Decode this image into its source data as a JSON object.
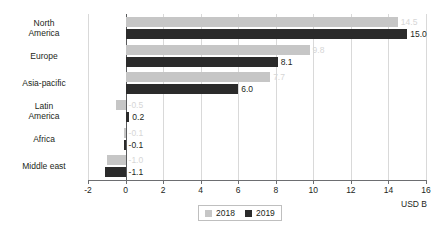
{
  "chart_data": {
    "type": "bar",
    "orientation": "horizontal",
    "title": "",
    "xlabel": "USD B",
    "ylabel": "",
    "xlim": [
      -2,
      16
    ],
    "xticks": [
      -2,
      0,
      2,
      4,
      6,
      8,
      10,
      12,
      14,
      16
    ],
    "xtick_labels": [
      "-2",
      "0",
      "2",
      "4",
      "6",
      "8",
      "10",
      "12",
      "14",
      "16"
    ],
    "grid": true,
    "legend_position": "bottom",
    "categories": [
      "North\nAmerica",
      "Europe",
      "Asia-pacific",
      "Latin\nAmerica",
      "Africa",
      "Middle east"
    ],
    "series": [
      {
        "name": "2018",
        "color": "#c6c6c6",
        "label_color": "#d6d6d6",
        "values": [
          14.5,
          9.8,
          7.7,
          -0.5,
          -0.1,
          -1.0
        ],
        "labels": [
          "14.5",
          "9.8",
          "7.7",
          "-0.5",
          "-0.1",
          "-1.0"
        ]
      },
      {
        "name": "2019",
        "color": "#2b2b2b",
        "label_color": "#231f20",
        "values": [
          15.0,
          8.1,
          6.0,
          0.2,
          -0.1,
          -1.1
        ],
        "labels": [
          "15.0",
          "8.1",
          "6.0",
          "0.2",
          "-0.1",
          "-1.1"
        ]
      }
    ]
  }
}
